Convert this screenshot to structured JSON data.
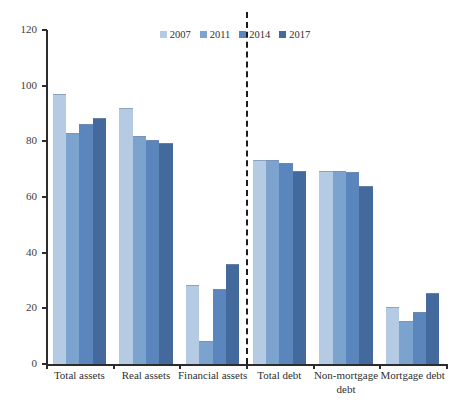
{
  "chart_data": {
    "type": "bar",
    "title": "",
    "subtitle": "",
    "xlabel": "",
    "ylabel": "",
    "ylim": [
      0,
      120
    ],
    "ytick_step": 20,
    "yticks": [
      0,
      20,
      40,
      60,
      80,
      100,
      120
    ],
    "grid": false,
    "legend_position": "top-center",
    "categories": [
      "Total assets",
      "Real assets",
      "Financial assets",
      "Total debt",
      "Non-mortgage debt",
      "Mortgage debt"
    ],
    "category_lines": [
      [
        "Total assets"
      ],
      [
        "Real assets"
      ],
      [
        "Financial assets"
      ],
      [
        "Total debt"
      ],
      [
        "Non-mortgage",
        "debt"
      ],
      [
        "Mortgage debt"
      ]
    ],
    "series": [
      {
        "name": "2007",
        "color": "#b5cbe4",
        "values": [
          96.5,
          91.5,
          28.0,
          73.0,
          69.0,
          20.0
        ]
      },
      {
        "name": "2011",
        "color": "#7ba3ce",
        "values": [
          82.5,
          81.5,
          8.0,
          73.0,
          69.0,
          15.0
        ]
      },
      {
        "name": "2014",
        "color": "#5b85bd",
        "values": [
          86.0,
          80.0,
          26.5,
          72.0,
          68.5,
          18.5
        ]
      },
      {
        "name": "2017",
        "color": "#44699d",
        "values": [
          88.0,
          79.0,
          35.5,
          69.0,
          63.5,
          25.0
        ]
      }
    ],
    "annotations": [
      {
        "name": "assets-debt-divider",
        "type": "vertical-dashed-line",
        "after_category": "Financial assets"
      }
    ]
  },
  "legend": {
    "entries": [
      {
        "label": "2007"
      },
      {
        "label": "2011"
      },
      {
        "label": "2014"
      },
      {
        "label": "2017"
      }
    ]
  }
}
